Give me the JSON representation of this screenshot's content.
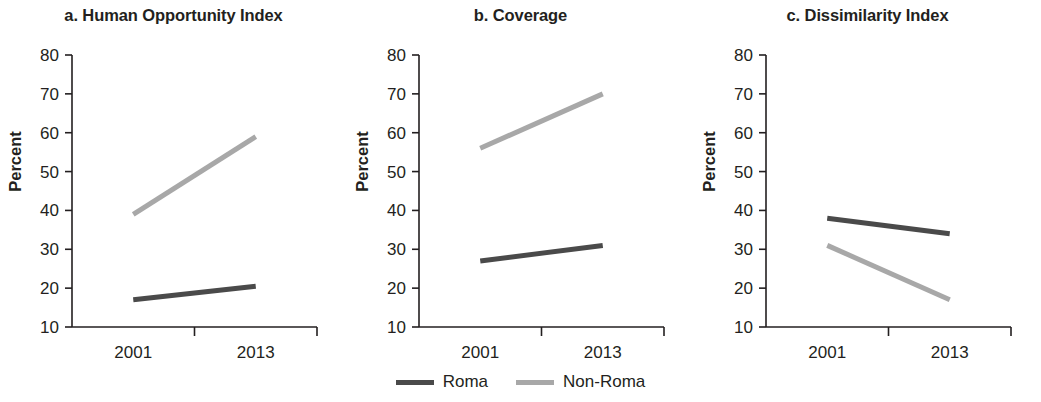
{
  "figure": {
    "y_axis_label": "Percent",
    "legend": [
      {
        "label": "Roma",
        "color": "#4a4a4a"
      },
      {
        "label": "Non-Roma",
        "color": "#a8a8a8"
      }
    ]
  },
  "chart_data": [
    {
      "type": "line",
      "title": "a. Human Opportunity Index",
      "xlabel": "",
      "ylabel": "Percent",
      "x": [
        "2001",
        "2013"
      ],
      "xtick_labels": [
        "2001",
        "2013"
      ],
      "ytick_labels": [
        "10",
        "20",
        "30",
        "40",
        "50",
        "60",
        "70",
        "80"
      ],
      "ylim": [
        10,
        80
      ],
      "grid": false,
      "legend_position": "bottom-center",
      "series": [
        {
          "name": "Roma",
          "values": [
            17,
            20.5
          ],
          "color": "#4a4a4a"
        },
        {
          "name": "Non-Roma",
          "values": [
            39,
            59
          ],
          "color": "#a8a8a8"
        }
      ]
    },
    {
      "type": "line",
      "title": "b. Coverage",
      "xlabel": "",
      "ylabel": "Percent",
      "x": [
        "2001",
        "2013"
      ],
      "xtick_labels": [
        "2001",
        "2013"
      ],
      "ytick_labels": [
        "10",
        "20",
        "30",
        "40",
        "50",
        "60",
        "70",
        "80"
      ],
      "ylim": [
        10,
        80
      ],
      "grid": false,
      "legend_position": "bottom-center",
      "series": [
        {
          "name": "Roma",
          "values": [
            27,
            31
          ],
          "color": "#4a4a4a"
        },
        {
          "name": "Non-Roma",
          "values": [
            56,
            70
          ],
          "color": "#a8a8a8"
        }
      ]
    },
    {
      "type": "line",
      "title": "c. Dissimilarity Index",
      "xlabel": "",
      "ylabel": "Percent",
      "x": [
        "2001",
        "2013"
      ],
      "xtick_labels": [
        "2001",
        "2013"
      ],
      "ytick_labels": [
        "10",
        "20",
        "30",
        "40",
        "50",
        "60",
        "70",
        "80"
      ],
      "ylim": [
        10,
        80
      ],
      "grid": false,
      "legend_position": "bottom-center",
      "series": [
        {
          "name": "Roma",
          "values": [
            38,
            34
          ],
          "color": "#4a4a4a"
        },
        {
          "name": "Non-Roma",
          "values": [
            31,
            17
          ],
          "color": "#a8a8a8"
        }
      ]
    }
  ]
}
